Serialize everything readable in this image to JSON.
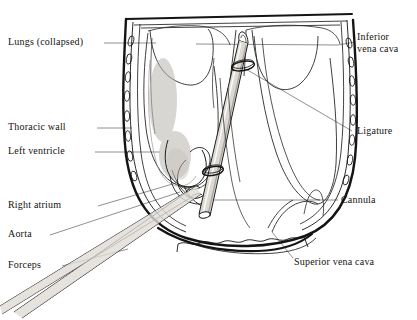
{
  "figure": {
    "kind": "anatomical-line-drawing",
    "background_color": "#ffffff",
    "line_color": "#1a1a1a",
    "leader_color": "#6f6f6f",
    "tube_fill_color": "#d8d5cf"
  },
  "labels": {
    "lungs": "Lungs (collapsed)",
    "thoracic_wall": "Thoracic wall",
    "left_ventricle": "Left ventricle",
    "right_atrium": "Right  atrium",
    "aorta": "Aorta",
    "forceps": "Forceps",
    "inferior_vena_cava_line1": "Inferior",
    "inferior_vena_cava_line2": "vena cava",
    "ligature": "Ligature",
    "cannula": "Cannula",
    "superior_vena_cava": "Superior vena cava"
  },
  "structures": [
    {
      "name": "thoracic-wall",
      "side": "both",
      "feature": "ribs shown as small ovals"
    },
    {
      "name": "lungs",
      "state": "collapsed"
    },
    {
      "name": "heart",
      "parts": [
        "left ventricle",
        "right atrium",
        "aorta"
      ]
    },
    {
      "name": "cannula",
      "orientation": "upper-right to lower-left"
    },
    {
      "name": "ligature",
      "count": 2
    },
    {
      "name": "forceps",
      "orientation": "diagonal to lower-left"
    },
    {
      "name": "diaphragm",
      "position": "bottom"
    },
    {
      "name": "inferior vena cava"
    },
    {
      "name": "superior vena cava"
    }
  ]
}
